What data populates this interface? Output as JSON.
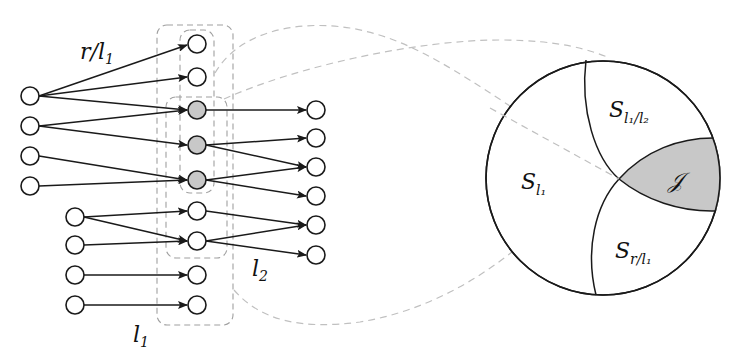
{
  "diagram": {
    "type": "network-and-set-diagram",
    "labels": {
      "edge_group_label": "r/l",
      "edge_group_label_sub": "1",
      "outer_box_label": "l",
      "outer_box_label_sub": "1",
      "middle_box_label": "l",
      "middle_box_label_sub": "2"
    },
    "left_column_a": {
      "x": 30,
      "nodes": [
        96,
        126,
        156,
        186
      ]
    },
    "left_column_b": {
      "x": 75,
      "nodes": [
        217,
        245,
        275,
        305
      ]
    },
    "middle_column": {
      "x": 197,
      "nodes": [
        {
          "y": 44,
          "shaded": false
        },
        {
          "y": 77,
          "shaded": false
        },
        {
          "y": 110,
          "shaded": true
        },
        {
          "y": 145,
          "shaded": true
        },
        {
          "y": 180,
          "shaded": true
        },
        {
          "y": 211,
          "shaded": false
        },
        {
          "y": 241,
          "shaded": false
        },
        {
          "y": 275,
          "shaded": false
        },
        {
          "y": 305,
          "shaded": false
        }
      ]
    },
    "right_column": {
      "x": 316,
      "nodes": [
        110,
        138,
        167,
        196,
        225,
        255
      ]
    },
    "edges_left_to_middle": [
      [
        "a0",
        "m0"
      ],
      [
        "a0",
        "m1"
      ],
      [
        "a0",
        "m2"
      ],
      [
        "a1",
        "m2"
      ],
      [
        "a1",
        "m3"
      ],
      [
        "a2",
        "m4"
      ],
      [
        "a3",
        "m4"
      ],
      [
        "b0",
        "m5"
      ],
      [
        "b0",
        "m6"
      ],
      [
        "b1",
        "m6"
      ],
      [
        "b2",
        "m7"
      ],
      [
        "b3",
        "m8"
      ]
    ],
    "edges_middle_to_right": [
      [
        "m2",
        "r0"
      ],
      [
        "m3",
        "r1"
      ],
      [
        "m3",
        "r2"
      ],
      [
        "m4",
        "r2"
      ],
      [
        "m4",
        "r3"
      ],
      [
        "m5",
        "r4"
      ],
      [
        "m6",
        "r4"
      ],
      [
        "m6",
        "r5"
      ]
    ],
    "set_circle": {
      "regions": [
        {
          "name": "S",
          "sub": "l₁",
          "id": "S_l1"
        },
        {
          "name": "S",
          "sub": "l₁/l₂",
          "id": "S_l1_l2"
        },
        {
          "name": "S",
          "sub": "r/l₁",
          "id": "S_r_l1"
        },
        {
          "name": "𝒥",
          "sub": "",
          "id": "J",
          "shaded": true
        }
      ]
    },
    "colors": {
      "stroke": "#1a1a1a",
      "shaded_fill": "#c8c8c8",
      "dashed_box": "#a0a0a0",
      "connector": "#c0c0c0"
    }
  }
}
